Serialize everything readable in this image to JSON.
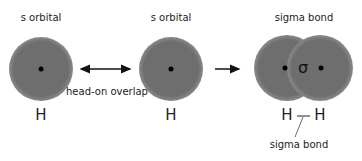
{
  "panels": [
    {
      "title": "s orbital",
      "atom": "H"
    },
    {
      "title": "s orbital",
      "atom": "H"
    },
    {
      "title": "sigma bond",
      "atoms": [
        "H",
        "H"
      ],
      "symbol": "σ",
      "bond_label": "sigma bond"
    }
  ],
  "arrows": {
    "double_arrow_label": "head-on overlap"
  },
  "colors": {
    "orbital": "#6e6e6e",
    "nucleus": "#000000",
    "text": "#222222"
  }
}
